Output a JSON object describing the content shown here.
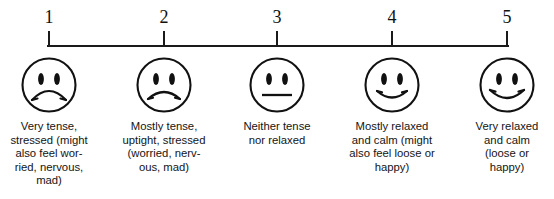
{
  "figure": {
    "name": "tension-relaxation-5-point-faces-scale",
    "axis": {
      "line_color": "#1a1a1a",
      "tick_count": 5
    },
    "points": [
      {
        "number": "1",
        "x": 49,
        "face": "frowning-face",
        "label": "Very tense,\nstressed (might\nalso feel wor-\nried, nervous,\nmad)"
      },
      {
        "number": "2",
        "x": 164,
        "face": "slightly-frowning-face",
        "label": "Mostly tense,\nuptight, stressed\n(worried, nerv-\nous, mad)"
      },
      {
        "number": "3",
        "x": 277,
        "face": "neutral-face",
        "label": "Neither tense\nnor relaxed"
      },
      {
        "number": "4",
        "x": 392,
        "face": "slightly-smiling-face",
        "label": "Mostly relaxed\nand calm (might\nalso feel loose or\nhappy)"
      },
      {
        "number": "5",
        "x": 507,
        "face": "smiling-face",
        "label": "Very relaxed\nand calm\n(loose or\nhappy)"
      }
    ]
  }
}
